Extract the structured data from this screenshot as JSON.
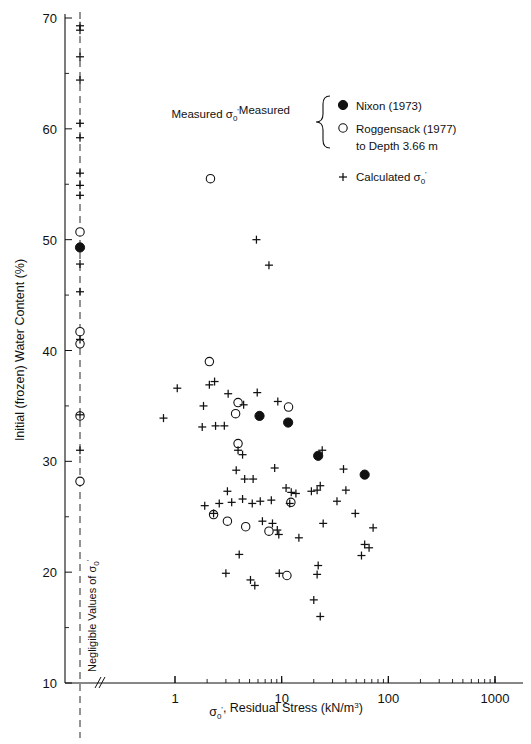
{
  "chart_data": {
    "type": "scatter",
    "title": "",
    "xlabel": "σ₀', Residual Stress (kN/m³)",
    "ylabel": "Initial (frozen) Water Content (%)",
    "xscale": "log",
    "xlim": [
      1,
      1000
    ],
    "ylim": [
      10,
      70
    ],
    "xticks": [
      1,
      10,
      100,
      1000
    ],
    "xticklabels": [
      "1",
      "10",
      "100",
      "1000"
    ],
    "yticks": [
      10,
      20,
      30,
      40,
      50,
      60,
      70
    ],
    "yticklabels": [
      "10",
      "20",
      "30",
      "40",
      "50",
      "60",
      "70"
    ],
    "yminorticks": [
      15,
      25,
      35,
      45,
      55,
      65
    ],
    "grid": false,
    "axis_break": true,
    "negligible_axis_label": "Negligible Values of σ₀'",
    "legend_position": "upper-right",
    "legend": {
      "group_label": "Measured σ₀'",
      "brace": true,
      "entries": [
        {
          "marker": "filled-circle",
          "label": "Nixon (1973)"
        },
        {
          "marker": "open-circle",
          "label": "Roggensack (1977)"
        },
        {
          "marker": "none",
          "label": "to Depth 3.66 m"
        },
        {
          "marker": "plus",
          "label": "Calculated σ₀'"
        }
      ]
    },
    "series": [
      {
        "name": "Nixon (1973)",
        "marker": "filled-circle",
        "points_negligible_y": [
          49.3
        ],
        "points": [
          {
            "x": 6.2,
            "y": 34.1
          },
          {
            "x": 11.5,
            "y": 33.5
          },
          {
            "x": 22.0,
            "y": 30.5
          },
          {
            "x": 60.0,
            "y": 28.8
          }
        ]
      },
      {
        "name": "Roggensack (1977)",
        "marker": "open-circle",
        "points_negligible_y": [
          50.7,
          41.7,
          40.6,
          34.1,
          28.2
        ],
        "points": [
          {
            "x": 2.15,
            "y": 55.5
          },
          {
            "x": 2.1,
            "y": 39.0
          },
          {
            "x": 3.9,
            "y": 35.3
          },
          {
            "x": 3.7,
            "y": 34.3
          },
          {
            "x": 11.6,
            "y": 34.9
          },
          {
            "x": 3.9,
            "y": 31.6
          },
          {
            "x": 12.2,
            "y": 26.3
          },
          {
            "x": 2.3,
            "y": 25.2
          },
          {
            "x": 3.1,
            "y": 24.6
          },
          {
            "x": 4.6,
            "y": 24.1
          },
          {
            "x": 7.6,
            "y": 23.7
          },
          {
            "x": 11.2,
            "y": 19.7
          }
        ]
      },
      {
        "name": "Calculated σ₀'",
        "marker": "plus",
        "points_negligible_y": [
          69.3,
          68.9,
          66.5,
          64.4,
          60.5,
          59.2,
          56.0,
          54.9,
          54.0,
          47.8,
          45.3,
          41.0,
          34.2,
          31.0
        ],
        "points": [
          {
            "x": 5.8,
            "y": 50.0
          },
          {
            "x": 7.6,
            "y": 47.7
          },
          {
            "x": 1.05,
            "y": 36.6
          },
          {
            "x": 2.1,
            "y": 36.9
          },
          {
            "x": 2.35,
            "y": 37.2
          },
          {
            "x": 3.15,
            "y": 36.1
          },
          {
            "x": 5.9,
            "y": 36.2
          },
          {
            "x": 9.2,
            "y": 35.4
          },
          {
            "x": 0.78,
            "y": 33.9
          },
          {
            "x": 1.85,
            "y": 35.0
          },
          {
            "x": 4.4,
            "y": 35.1
          },
          {
            "x": 1.8,
            "y": 33.1
          },
          {
            "x": 2.4,
            "y": 33.2
          },
          {
            "x": 2.9,
            "y": 33.2
          },
          {
            "x": 3.9,
            "y": 31.0
          },
          {
            "x": 4.3,
            "y": 30.6
          },
          {
            "x": 3.75,
            "y": 29.2
          },
          {
            "x": 4.5,
            "y": 28.4
          },
          {
            "x": 5.4,
            "y": 28.4
          },
          {
            "x": 8.6,
            "y": 29.4
          },
          {
            "x": 3.1,
            "y": 27.3
          },
          {
            "x": 11.0,
            "y": 27.6
          },
          {
            "x": 12.3,
            "y": 27.2
          },
          {
            "x": 13.6,
            "y": 27.1
          },
          {
            "x": 19.0,
            "y": 27.3
          },
          {
            "x": 21.5,
            "y": 27.4
          },
          {
            "x": 24.0,
            "y": 31.0
          },
          {
            "x": 1.9,
            "y": 26.0
          },
          {
            "x": 2.6,
            "y": 26.2
          },
          {
            "x": 3.4,
            "y": 26.3
          },
          {
            "x": 4.3,
            "y": 26.6
          },
          {
            "x": 5.3,
            "y": 26.2
          },
          {
            "x": 6.3,
            "y": 26.4
          },
          {
            "x": 8.0,
            "y": 26.5
          },
          {
            "x": 11.9,
            "y": 26.2
          },
          {
            "x": 2.3,
            "y": 25.3
          },
          {
            "x": 33.0,
            "y": 26.4
          },
          {
            "x": 49.0,
            "y": 25.3
          },
          {
            "x": 6.6,
            "y": 24.6
          },
          {
            "x": 8.2,
            "y": 24.4
          },
          {
            "x": 9.1,
            "y": 23.8
          },
          {
            "x": 9.4,
            "y": 23.4
          },
          {
            "x": 72.0,
            "y": 24.0
          },
          {
            "x": 14.5,
            "y": 23.1
          },
          {
            "x": 60.0,
            "y": 22.5
          },
          {
            "x": 66.0,
            "y": 22.2
          },
          {
            "x": 56.0,
            "y": 21.5
          },
          {
            "x": 4.0,
            "y": 21.6
          },
          {
            "x": 23.0,
            "y": 27.8
          },
          {
            "x": 24.5,
            "y": 24.4
          },
          {
            "x": 3.0,
            "y": 19.9
          },
          {
            "x": 5.1,
            "y": 19.3
          },
          {
            "x": 9.5,
            "y": 19.9
          },
          {
            "x": 22.0,
            "y": 20.6
          },
          {
            "x": 21.5,
            "y": 19.8
          },
          {
            "x": 5.6,
            "y": 18.8
          },
          {
            "x": 20.0,
            "y": 17.5
          },
          {
            "x": 23.0,
            "y": 16.0
          },
          {
            "x": 38.0,
            "y": 29.3
          },
          {
            "x": 40.0,
            "y": 27.4
          }
        ]
      }
    ]
  }
}
